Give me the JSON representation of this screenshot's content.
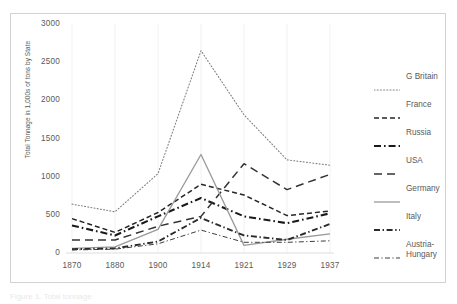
{
  "figure": {
    "caption": "Figure 1. Total tonnage"
  },
  "axis": {
    "y_title": "Total Tonnage in 1,000s of tons by State",
    "y_ticks": [
      "0",
      "500",
      "1000",
      "1500",
      "2000",
      "2500",
      "3000"
    ],
    "x_ticks": [
      "1870",
      "1880",
      "1900",
      "1914",
      "1921",
      "1929",
      "1937"
    ]
  },
  "legend": {
    "entries": [
      {
        "label": "G Britain",
        "style": "dotted",
        "color": "#808080"
      },
      {
        "label": "France",
        "style": "dashed",
        "color": "#262626"
      },
      {
        "label": "Russia",
        "style": "dash-dot-thick",
        "color": "#1a1a1a"
      },
      {
        "label": "USA",
        "style": "long-dash",
        "color": "#333333"
      },
      {
        "label": "Germany",
        "style": "solid",
        "color": "#9a9a9a"
      },
      {
        "label": "Italy",
        "style": "dash-dot",
        "color": "#2b2b2b"
      },
      {
        "label": "Austria-Hungary",
        "style": "thin-dash-dot",
        "color": "#3d3d3d"
      }
    ]
  },
  "chart_data": {
    "type": "line",
    "title": "",
    "xlabel": "",
    "ylabel": "Total Tonnage in 1,000s of tons by State",
    "categories": [
      "1870",
      "1880",
      "1900",
      "1914",
      "1921",
      "1929",
      "1937"
    ],
    "ylim": [
      0,
      3000
    ],
    "ytick_step": 500,
    "grid": "vertical-light",
    "legend_position": "right",
    "series": [
      {
        "name": "G Britain",
        "values": [
          640,
          540,
          1040,
          2650,
          1810,
          1220,
          1150
        ]
      },
      {
        "name": "France",
        "values": [
          450,
          270,
          530,
          900,
          760,
          490,
          550
        ]
      },
      {
        "name": "Russia",
        "values": [
          360,
          230,
          480,
          720,
          480,
          390,
          520
        ]
      },
      {
        "name": "USA",
        "values": [
          170,
          170,
          350,
          480,
          1170,
          830,
          1030
        ]
      },
      {
        "name": "Germany",
        "values": [
          60,
          80,
          310,
          1290,
          100,
          180,
          250
        ]
      },
      {
        "name": "Italy",
        "values": [
          50,
          60,
          150,
          460,
          230,
          170,
          380
        ]
      },
      {
        "name": "Austria-Hungary",
        "values": [
          40,
          50,
          120,
          300,
          140,
          140,
          160
        ]
      }
    ]
  }
}
